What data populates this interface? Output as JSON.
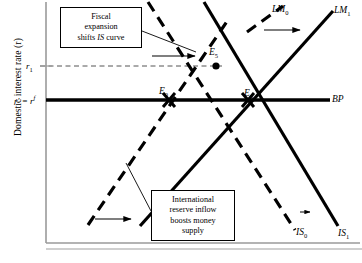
{
  "figure": {
    "type": "economics-diagram",
    "model": "IS-LM-BP (Mundell-Fleming) fixed exchange rate fiscal expansion"
  },
  "axes": {
    "ylabel": "Domestic interest rate (r)",
    "xlabel": "",
    "yticks": [
      {
        "id": "r1",
        "label_html": "r<sub>1</sub>"
      },
      {
        "id": "rf",
        "label_html": "r' = r<sup>f</sup>"
      }
    ]
  },
  "curves": [
    {
      "name": "LM0",
      "label_html": "LM<sub>0</sub>",
      "style": "dashed",
      "slope": "upward"
    },
    {
      "name": "LM1",
      "label_html": "LM<sub>1</sub>",
      "style": "solid",
      "slope": "upward"
    },
    {
      "name": "IS0",
      "label_html": "IS<sub>0</sub>",
      "style": "dashed",
      "slope": "downward"
    },
    {
      "name": "IS1",
      "label_html": "IS<sub>1</sub>",
      "style": "solid",
      "slope": "downward"
    },
    {
      "name": "BP",
      "label_html": "BP",
      "style": "solid-thick",
      "slope": "horizontal"
    }
  ],
  "equilibria": [
    {
      "id": "E0",
      "label_html": "E<sub>0</sub>"
    },
    {
      "id": "E5",
      "label_html": "E<sub>5</sub>"
    },
    {
      "id": "E6",
      "label_html": "E<sub>6</sub>"
    }
  ],
  "callouts": {
    "fiscal": {
      "line1": "Fiscal",
      "line2": "expansion",
      "line3_pre": "shifts ",
      "line3_em": "IS",
      "line3_post": " curve"
    },
    "reserve": {
      "line1": "International",
      "line2": "reserve inflow",
      "line3": "boosts money",
      "line4": "supply"
    }
  },
  "colors": {
    "ink": "#000000",
    "axis": "#9a9a9a",
    "background": "#ffffff"
  }
}
